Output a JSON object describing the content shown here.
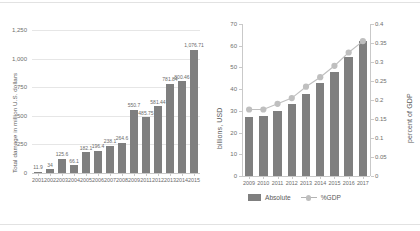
{
  "chart_data": [
    {
      "id": "left",
      "type": "bar",
      "title": "",
      "xlabel": "",
      "ylabel": "Total damage in million U.S. dollars",
      "ylim": [
        0,
        1250
      ],
      "yticks": [
        0,
        250,
        500,
        750,
        1000,
        1250
      ],
      "ytick_labels": [
        "0",
        "250",
        "500",
        "750",
        "1,000",
        "1,250"
      ],
      "grid": true,
      "legend": "none",
      "categories": [
        "2001",
        "2002",
        "2003",
        "2004",
        "2005",
        "2006",
        "2007",
        "2008",
        "2009",
        "2011",
        "2012",
        "2013",
        "2014",
        "2015"
      ],
      "values": [
        11.9,
        34,
        125.6,
        66.1,
        182.1,
        196.4,
        238.1,
        264.6,
        550.7,
        485.75,
        581.44,
        781.84,
        800.46,
        1076.71
      ],
      "data_labels": [
        "11.9",
        "34",
        "125.6",
        "66.1",
        "182.1",
        "196.4",
        "238.1",
        "264.6",
        "550.7",
        "485.75",
        "581.44",
        "781.84",
        "800.46",
        "1,076.71"
      ],
      "bar_color": "#7f7f7f"
    },
    {
      "id": "right",
      "type": "bar+line",
      "title": "",
      "xlabel": "",
      "ylabel": "billions, USD",
      "y2label": "percent of GDP",
      "ylim": [
        0,
        70
      ],
      "yticks": [
        0,
        10,
        20,
        30,
        40,
        50,
        60,
        70
      ],
      "ytick_labels": [
        "0",
        "10",
        "20",
        "30",
        "40",
        "50",
        "60",
        "70"
      ],
      "y2lim": [
        0,
        0.4
      ],
      "y2ticks": [
        0,
        0.05,
        0.1,
        0.15,
        0.2,
        0.25,
        0.3,
        0.35,
        0.4
      ],
      "y2tick_labels": [
        "0",
        "0.05",
        "0.1",
        "0.15",
        "0.2",
        "0.25",
        "0.3",
        "0.35",
        "0.4"
      ],
      "grid": false,
      "legend_position": "bottom",
      "categories": [
        "2009",
        "2010",
        "2011",
        "2012",
        "2013",
        "2014",
        "2015",
        "2016",
        "2017"
      ],
      "series": [
        {
          "name": "Absolute",
          "kind": "bar",
          "axis": "left",
          "color": "#7f7f7f",
          "values": [
            27,
            27.5,
            30,
            33,
            38,
            43,
            48,
            55,
            62
          ]
        },
        {
          "name": "%GDP",
          "kind": "line",
          "axis": "right",
          "color": "#bfbfbf",
          "values": [
            0.175,
            0.175,
            0.19,
            0.205,
            0.235,
            0.26,
            0.29,
            0.325,
            0.355
          ]
        }
      ]
    }
  ],
  "legend": {
    "items": [
      {
        "label": "Absolute",
        "marker": "bar-swatch"
      },
      {
        "label": "%GDP",
        "marker": "line-marker"
      }
    ]
  }
}
